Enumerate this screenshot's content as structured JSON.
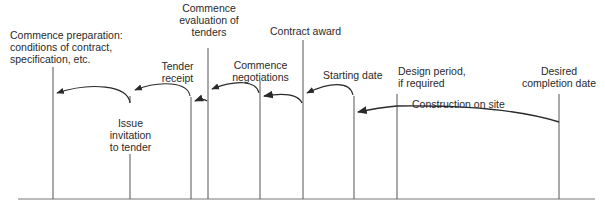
{
  "diagram": {
    "type": "timeline",
    "stroke_color": "#3a3a3a",
    "text_color": "#2a2a2a",
    "baseline": {
      "x1": 18,
      "x2": 595,
      "y": 199
    },
    "milestones": [
      {
        "id": "commence-preparation",
        "label": "Commence preparation:\nconditions of contract,\nspecification, etc.",
        "x": 53,
        "top": 67
      },
      {
        "id": "issue-invitation",
        "label": "Issue\ninvitation\nto tender",
        "x": 130,
        "top": 160
      },
      {
        "id": "tender-receipt",
        "label": "Tender\nreceipt",
        "x": 192,
        "top": 97
      },
      {
        "id": "commence-evaluation",
        "label": "Commence\nevaluation of\ntenders",
        "x": 208,
        "top": 48
      },
      {
        "id": "commence-negotiations",
        "label": "Commence\nnegotiations",
        "x": 259,
        "top": 81
      },
      {
        "id": "contract-award",
        "label": "Contract award",
        "x": 303,
        "top": 40
      },
      {
        "id": "starting-date",
        "label": "Starting date",
        "x": 353,
        "top": 96
      },
      {
        "id": "design-period",
        "label": "Design period,\nif required",
        "x": 397,
        "top": 94
      },
      {
        "id": "desired-completion",
        "label": "Desired\ncompletion date",
        "x": 559,
        "top": 94
      }
    ],
    "span_label": "Construction on site"
  }
}
